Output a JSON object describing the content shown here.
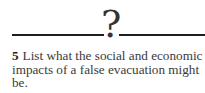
{
  "divider": {
    "icon": "question-mark-icon",
    "glyph": "?"
  },
  "question": {
    "number": "5",
    "text": "List what the social and economic impacts of a false evacuation might be."
  }
}
